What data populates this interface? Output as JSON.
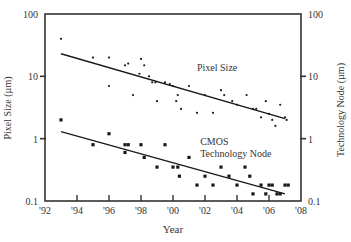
{
  "chart_data": {
    "type": "scatter",
    "title": "",
    "xlabel": "Year",
    "ylabel": "Pixel Size (µm)",
    "y2label": "Technology Node (µm)",
    "xlim": [
      1992,
      2008
    ],
    "ylim": [
      0.1,
      100
    ],
    "yscale": "log",
    "grid": false,
    "legend": "inline annotations",
    "x_ticks": [
      "'92",
      "'94",
      "'96",
      "'98",
      "'00",
      "'02",
      "'04",
      "'06",
      "'08"
    ],
    "x_tick_values": [
      1992,
      1994,
      1996,
      1998,
      2000,
      2002,
      2004,
      2006,
      2008
    ],
    "y_ticks": [
      "0.1",
      "1",
      "10",
      "100"
    ],
    "y_tick_values": [
      0.1,
      1,
      10,
      100
    ],
    "y2_ticks": [
      "0.1",
      "1",
      "10",
      "100"
    ],
    "annotations": [
      {
        "text": "Pixel Size",
        "x": 2001.5,
        "y": 12
      },
      {
        "text": "CMOS",
        "x": 2001.7,
        "y": 0.8
      },
      {
        "text": "Technology Node",
        "x": 2001.7,
        "y": 0.5
      }
    ],
    "series": [
      {
        "name": "Pixel Size",
        "marker": "dot",
        "points": [
          [
            1993,
            40
          ],
          [
            1995,
            20
          ],
          [
            1996,
            20
          ],
          [
            1996,
            7
          ],
          [
            1997,
            15
          ],
          [
            1997.2,
            16
          ],
          [
            1997.5,
            5
          ],
          [
            1997.9,
            11
          ],
          [
            1998,
            19
          ],
          [
            1998.2,
            15
          ],
          [
            1998.5,
            10
          ],
          [
            1998.7,
            8
          ],
          [
            1998.9,
            8
          ],
          [
            1999,
            4
          ],
          [
            1999.5,
            8
          ],
          [
            1999.8,
            7.5
          ],
          [
            2000,
            7
          ],
          [
            2000.2,
            4
          ],
          [
            2000.3,
            5
          ],
          [
            2000.5,
            3
          ],
          [
            2001,
            7
          ],
          [
            2001.5,
            2.6
          ],
          [
            2002,
            5
          ],
          [
            2002.5,
            2.6
          ],
          [
            2003,
            6
          ],
          [
            2003.2,
            5
          ],
          [
            2003.7,
            4
          ],
          [
            2004,
            3.5
          ],
          [
            2004.6,
            5
          ],
          [
            2005,
            3
          ],
          [
            2005.2,
            3
          ],
          [
            2005.5,
            2.2
          ],
          [
            2005.8,
            4
          ],
          [
            2006,
            2.5
          ],
          [
            2006.2,
            2
          ],
          [
            2006.4,
            1.6
          ],
          [
            2006.7,
            3.5
          ],
          [
            2007,
            2.2
          ],
          [
            2007.1,
            2
          ]
        ],
        "trend": {
          "x": [
            1993,
            2007
          ],
          "y": [
            23,
            2.1
          ]
        }
      },
      {
        "name": "CMOS Technology Node",
        "marker": "square",
        "points": [
          [
            1993,
            2
          ],
          [
            1995,
            0.8
          ],
          [
            1996,
            1.2
          ],
          [
            1997,
            0.8
          ],
          [
            1997.2,
            0.8
          ],
          [
            1997,
            0.6
          ],
          [
            1998,
            0.8
          ],
          [
            1998.2,
            0.5
          ],
          [
            1999,
            0.35
          ],
          [
            1999.5,
            0.8
          ],
          [
            2000,
            0.35
          ],
          [
            2000.3,
            0.35
          ],
          [
            2000.4,
            0.25
          ],
          [
            2001,
            0.5
          ],
          [
            2001.5,
            0.18
          ],
          [
            2002,
            0.25
          ],
          [
            2002.5,
            0.18
          ],
          [
            2003,
            0.35
          ],
          [
            2003.5,
            0.25
          ],
          [
            2004,
            0.18
          ],
          [
            2004.5,
            0.35
          ],
          [
            2004.8,
            0.25
          ],
          [
            2005,
            0.13
          ],
          [
            2005.5,
            0.18
          ],
          [
            2005.8,
            0.13
          ],
          [
            2006,
            0.18
          ],
          [
            2006.2,
            0.18
          ],
          [
            2006.5,
            0.13
          ],
          [
            2006.7,
            0.13
          ],
          [
            2007,
            0.18
          ],
          [
            2007.2,
            0.18
          ]
        ],
        "trend": {
          "x": [
            1993,
            2007
          ],
          "y": [
            1.3,
            0.13
          ]
        }
      }
    ]
  },
  "colors": {
    "axis": "#333333",
    "series": "#1a1a1a",
    "background": "#ffffff"
  }
}
